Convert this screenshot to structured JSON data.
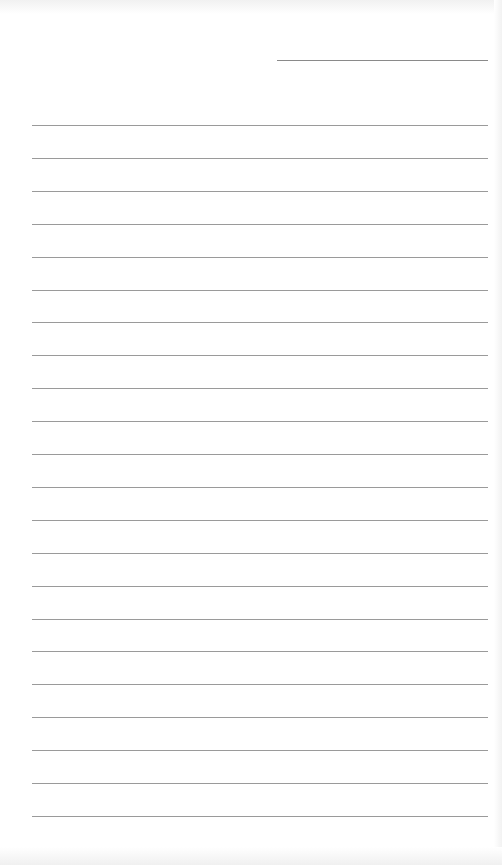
{
  "page": {
    "type": "blank lined paper",
    "background_color": "#ffffff",
    "line_color": "#9a9a9a",
    "header_line": {
      "label": "",
      "present": true
    },
    "ruled_line_count": 22,
    "lines": []
  }
}
